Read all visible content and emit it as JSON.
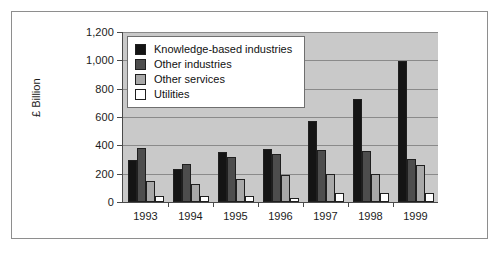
{
  "chart_data": {
    "type": "bar",
    "title": "",
    "subtitle": "",
    "xlabel": "",
    "ylabel": "£ Billion",
    "categories": [
      "1993",
      "1994",
      "1995",
      "1996",
      "1997",
      "1998",
      "1999"
    ],
    "ylim": [
      0,
      1200
    ],
    "ytick_values": [
      0,
      200,
      400,
      600,
      800,
      1000,
      1200
    ],
    "ytick_labels": [
      "0",
      "200",
      "400",
      "600",
      "800",
      "1,000",
      "1,200"
    ],
    "grid": true,
    "legend_position": "top-left-inside",
    "series": [
      {
        "name": "Knowledge-based industries",
        "color": "#141414",
        "values": [
          300,
          230,
          350,
          375,
          570,
          730,
          995
        ]
      },
      {
        "name": "Other industries",
        "color": "#4d4d4d",
        "values": [
          380,
          265,
          315,
          340,
          370,
          360,
          305
        ]
      },
      {
        "name": "Other services",
        "color": "#a8a8a8",
        "values": [
          145,
          125,
          165,
          190,
          200,
          200,
          260
        ]
      },
      {
        "name": "Utilities",
        "color": "#ffffff",
        "values": [
          45,
          40,
          40,
          30,
          65,
          65,
          65
        ]
      }
    ]
  },
  "legend": {
    "entries": [
      {
        "label": "Knowledge-based industries",
        "color": "#141414"
      },
      {
        "label": "Other industries",
        "color": "#4d4d4d"
      },
      {
        "label": "Other services",
        "color": "#a8a8a8"
      },
      {
        "label": "Utilities",
        "color": "#ffffff"
      }
    ]
  },
  "colors": {
    "plot_background": "#c9c9c9",
    "gridline": "#8a8a8a",
    "axis": "#4a4a4a",
    "frame": "#8e8e8e",
    "page_background": "#ffffff",
    "text": "#1b1b1b"
  }
}
